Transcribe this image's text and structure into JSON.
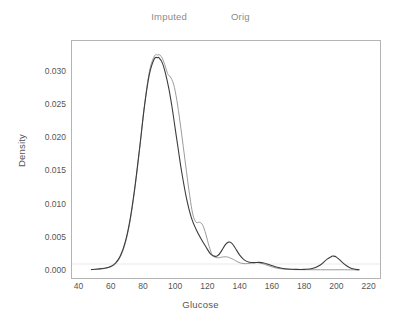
{
  "chart_data": {
    "type": "line",
    "title": "",
    "xlabel": "Glucose",
    "ylabel": "Density",
    "xlim": [
      36,
      227
    ],
    "ylim": [
      -0.0012,
      0.0345
    ],
    "xticks": [
      40,
      60,
      80,
      100,
      120,
      140,
      160,
      180,
      200,
      220
    ],
    "xtick_labels": [
      "40",
      "60",
      "80",
      "100",
      "120",
      "140",
      "160",
      "180",
      "200",
      "220"
    ],
    "yticks": [
      0.0,
      0.005,
      0.01,
      0.015,
      0.02,
      0.025,
      0.03
    ],
    "ytick_labels": [
      "0.000",
      "0.005",
      "0.010",
      "0.015",
      "0.020",
      "0.025",
      "0.030"
    ],
    "grid": false,
    "legend_position": "top-center",
    "series": [
      {
        "name": "Imputed",
        "color": "#3c3c3c",
        "x": [
          48,
          52,
          56,
          60,
          63,
          66,
          69,
          72,
          75,
          78,
          81,
          84,
          87,
          89,
          90,
          92,
          94,
          96,
          98,
          100,
          102,
          104,
          107,
          110,
          113,
          116,
          119,
          122,
          125,
          127,
          129,
          131,
          133,
          135,
          137,
          140,
          143,
          146,
          149,
          152,
          155,
          158,
          162,
          166,
          170,
          175,
          180,
          185,
          190,
          194,
          197,
          198,
          200,
          203,
          206,
          209,
          212,
          214
        ],
        "y": [
          8e-05,
          0.00015,
          0.00026,
          0.00055,
          0.00105,
          0.00215,
          0.0042,
          0.0076,
          0.0125,
          0.0185,
          0.0248,
          0.0295,
          0.0318,
          0.032,
          0.03195,
          0.0312,
          0.0296,
          0.0274,
          0.0246,
          0.0213,
          0.018,
          0.0148,
          0.0108,
          0.0079,
          0.0061,
          0.0047,
          0.0035,
          0.0024,
          0.00205,
          0.0023,
          0.003,
          0.0038,
          0.0042,
          0.00405,
          0.0034,
          0.00225,
          0.0015,
          0.00118,
          0.00112,
          0.00115,
          0.00105,
          0.00082,
          0.0005,
          0.00028,
          0.00016,
          0.0001,
          0.0001,
          0.00022,
          0.00075,
          0.0016,
          0.00205,
          0.0021,
          0.00195,
          0.0013,
          0.00068,
          0.00028,
          0.0001,
          5e-05
        ]
      },
      {
        "name": "Orig",
        "color": "#909090",
        "x": [
          48,
          52,
          56,
          60,
          63,
          66,
          69,
          72,
          75,
          78,
          81,
          84,
          87,
          89,
          91,
          93,
          95,
          96,
          97,
          99,
          101,
          103,
          105,
          107,
          109,
          111,
          113,
          115,
          117,
          119,
          121,
          123,
          125,
          127,
          129,
          131,
          133,
          136,
          139,
          142,
          145,
          148,
          151,
          154,
          157,
          161,
          165,
          170,
          176,
          182,
          190,
          198,
          205,
          212,
          214
        ],
        "y": [
          6e-05,
          0.00012,
          0.00022,
          0.00048,
          0.00095,
          0.002,
          0.004,
          0.00735,
          0.0123,
          0.0184,
          0.0249,
          0.0299,
          0.0322,
          0.0324,
          0.0323,
          0.0313,
          0.0298,
          0.0293,
          0.0291,
          0.028,
          0.0256,
          0.0223,
          0.0186,
          0.0148,
          0.0112,
          0.0083,
          0.0072,
          0.0072,
          0.0068,
          0.0054,
          0.0036,
          0.00225,
          0.0019,
          0.00185,
          0.00195,
          0.002,
          0.00192,
          0.0016,
          0.0012,
          0.00098,
          0.00098,
          0.00108,
          0.00112,
          0.00098,
          0.00072,
          0.0004,
          0.0002,
          0.0001,
          6e-05,
          5e-05,
          4e-05,
          4e-05,
          4e-05,
          3e-05,
          3e-05
        ]
      }
    ]
  },
  "legend": {
    "entries": [
      {
        "label": "Imputed"
      },
      {
        "label": "Orig"
      }
    ]
  },
  "axes": {
    "x_title": "Glucose",
    "y_title": "Density"
  },
  "colors": {
    "frame": "#b4b4b4",
    "text": "#555555",
    "legend_text": "#8a8a8a",
    "background": "#ffffff"
  }
}
